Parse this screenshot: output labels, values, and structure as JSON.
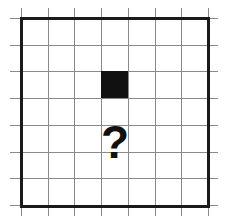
{
  "grid": {
    "columns": 7,
    "rows": 7,
    "origin_x": 20,
    "origin_y": 17,
    "cell_size": 26.7,
    "line_color": "#8a8a8a",
    "border_color": "#1a1a1a"
  },
  "filled_cells": [
    {
      "col": 3,
      "row": 2,
      "color": "#111111"
    }
  ],
  "question_mark": {
    "text": "?",
    "col": 3,
    "row_center": 4.6,
    "font_size": 46
  }
}
